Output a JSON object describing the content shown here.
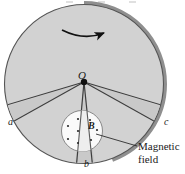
{
  "figure": {
    "colors": {
      "disk_face": "#d2d2d2",
      "disk_rim_dark": "#8f8f8f",
      "outline": "#4a4a4a",
      "field_circle": "#fbfbfb",
      "wedge_fill": "#c0c0c0",
      "text": "#1a1a1a",
      "arrow": "#111111"
    },
    "labels": {
      "center": "O",
      "point_a": "a",
      "point_b": "b",
      "point_c": "c",
      "field_symbol": "B",
      "magnetic_field_line1": "Magnetic",
      "magnetic_field_line2": "field"
    },
    "icons": {
      "rotation_arrow": "curved-arrow-clockwise-icon",
      "field_out_of_page": "field-dot-icon"
    },
    "geometry": {
      "disk_center_x": 84,
      "disk_center_y": 84,
      "disk_radius": 80,
      "hub_x": 84,
      "hub_y": 82,
      "field_circle_x": 82,
      "field_circle_y": 131,
      "field_circle_r": 21
    }
  }
}
